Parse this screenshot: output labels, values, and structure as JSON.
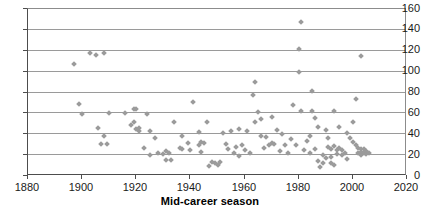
{
  "chart_data": {
    "type": "scatter",
    "title": "",
    "xlabel": "Mid-career season",
    "ylabel": "",
    "xlim": [
      1880,
      2020
    ],
    "ylim": [
      0,
      160
    ],
    "xticks": [
      1880,
      1900,
      1920,
      1940,
      1960,
      1980,
      2000,
      2020
    ],
    "xtick_labels": [
      "1880",
      "1900",
      "1920",
      "1940",
      "1960",
      "1980",
      "2000",
      "2020"
    ],
    "yticks": [
      0,
      20,
      40,
      60,
      80,
      100,
      120,
      140,
      160
    ],
    "ytick_labels": [
      "0",
      "20",
      "40",
      "60",
      "80",
      "100",
      "120",
      "140",
      "160"
    ],
    "grid": "horizontal",
    "legend": "none",
    "marker": "diamond",
    "marker_color": "#9b9b9b",
    "points": [
      [
        1897,
        107
      ],
      [
        1903,
        118
      ],
      [
        1905,
        116
      ],
      [
        1908,
        118
      ],
      [
        1899,
        69
      ],
      [
        1900,
        59
      ],
      [
        1906,
        46
      ],
      [
        1907,
        31
      ],
      [
        1908,
        38
      ],
      [
        1909,
        31
      ],
      [
        1916,
        60
      ],
      [
        1919,
        64
      ],
      [
        1920,
        64
      ],
      [
        1918,
        49
      ],
      [
        1919,
        52
      ],
      [
        1920,
        45
      ],
      [
        1921,
        46
      ],
      [
        1921,
        43
      ],
      [
        1924,
        59
      ],
      [
        1925,
        43
      ],
      [
        1923,
        27
      ],
      [
        1925,
        20
      ],
      [
        1931,
        24
      ],
      [
        1931,
        15
      ],
      [
        1933,
        15
      ],
      [
        1934,
        52
      ],
      [
        1937,
        38
      ],
      [
        1936,
        27
      ],
      [
        1937,
        26
      ],
      [
        1941,
        71
      ],
      [
        1943,
        42
      ],
      [
        1944,
        33
      ],
      [
        1943,
        30
      ],
      [
        1945,
        32
      ],
      [
        1946,
        52
      ],
      [
        1944,
        23
      ],
      [
        1947,
        10
      ],
      [
        1948,
        13
      ],
      [
        1949,
        12
      ],
      [
        1950,
        11
      ],
      [
        1951,
        13
      ],
      [
        1952,
        41
      ],
      [
        1955,
        43
      ],
      [
        1953,
        31
      ],
      [
        1954,
        26
      ],
      [
        1956,
        22
      ],
      [
        1957,
        28
      ],
      [
        1958,
        19
      ],
      [
        1963,
        78
      ],
      [
        1964,
        90
      ],
      [
        1965,
        61
      ],
      [
        1964,
        52
      ],
      [
        1966,
        38
      ],
      [
        1968,
        37
      ],
      [
        1967,
        27
      ],
      [
        1969,
        30
      ],
      [
        1970,
        32
      ],
      [
        1971,
        31
      ],
      [
        1972,
        44
      ],
      [
        1975,
        30
      ],
      [
        1978,
        68
      ],
      [
        1979,
        30
      ],
      [
        1980,
        100
      ],
      [
        1981,
        148
      ],
      [
        1980,
        122
      ],
      [
        1981,
        62
      ],
      [
        1983,
        34
      ],
      [
        1984,
        38
      ],
      [
        1985,
        62
      ],
      [
        1985,
        81
      ],
      [
        1986,
        56
      ],
      [
        1987,
        47
      ],
      [
        1986,
        26
      ],
      [
        1987,
        14
      ],
      [
        1988,
        9
      ],
      [
        1989,
        20
      ],
      [
        1989,
        12
      ],
      [
        1990,
        44
      ],
      [
        1991,
        36
      ],
      [
        1991,
        28
      ],
      [
        1990,
        17
      ],
      [
        1992,
        26
      ],
      [
        1992,
        18
      ],
      [
        1992,
        12
      ],
      [
        1993,
        11
      ],
      [
        1993,
        62
      ],
      [
        1993,
        29
      ],
      [
        1994,
        25
      ],
      [
        1994,
        21
      ],
      [
        1995,
        47
      ],
      [
        1995,
        27
      ],
      [
        1996,
        25
      ],
      [
        1996,
        20
      ],
      [
        1997,
        22
      ],
      [
        1998,
        16
      ],
      [
        1999,
        36
      ],
      [
        2000,
        33
      ],
      [
        2001,
        30
      ],
      [
        2002,
        27
      ],
      [
        2002,
        22
      ],
      [
        2003,
        26
      ],
      [
        2003,
        23
      ],
      [
        2003,
        20
      ],
      [
        2004,
        26
      ],
      [
        2004,
        22
      ],
      [
        2005,
        21
      ],
      [
        2005,
        24
      ],
      [
        2006,
        22
      ],
      [
        2003,
        115
      ],
      [
        2001,
        74
      ],
      [
        2000,
        52
      ],
      [
        1998,
        41
      ],
      [
        1962,
        22
      ],
      [
        1960,
        25
      ],
      [
        1959,
        30
      ],
      [
        1973,
        24
      ],
      [
        1976,
        22
      ],
      [
        1977,
        35
      ],
      [
        1982,
        25
      ],
      [
        1984,
        22
      ],
      [
        1970,
        57
      ],
      [
        1966,
        55
      ],
      [
        1930,
        21
      ],
      [
        1932,
        22
      ],
      [
        1927,
        36
      ],
      [
        1928,
        22
      ],
      [
        1939,
        32
      ],
      [
        1940,
        25
      ],
      [
        1958,
        45
      ],
      [
        1961,
        43
      ],
      [
        1974,
        40
      ],
      [
        1910,
        60
      ]
    ]
  }
}
